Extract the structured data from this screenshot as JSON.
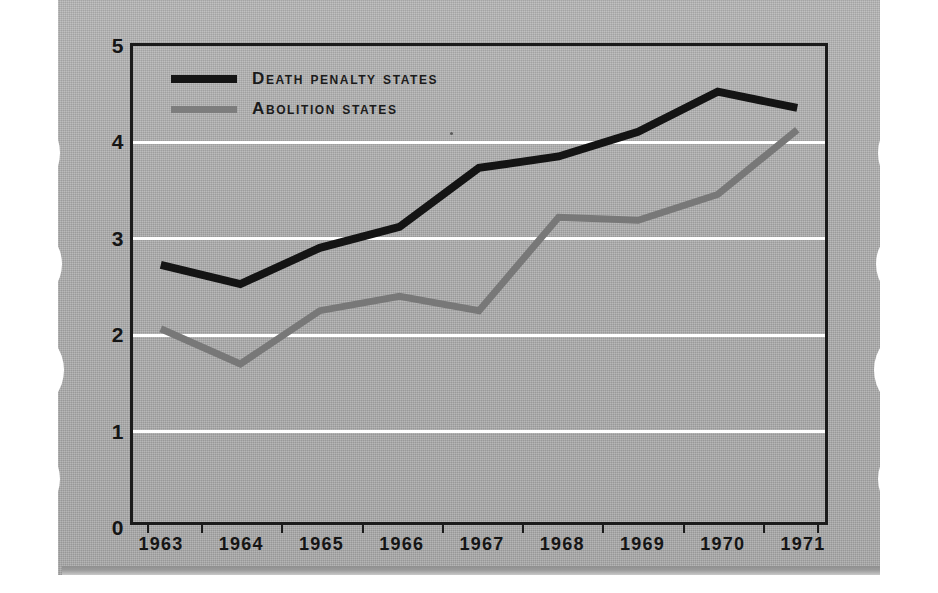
{
  "page": {
    "media": "scanned-book-page",
    "background_color": "#a9a9a9",
    "ink_color": "#1b1b1b"
  },
  "legend": {
    "position": "top-left-inside-plot",
    "entries": [
      {
        "label": "Death penalty states",
        "color": "#141414",
        "swatch": "line"
      },
      {
        "label": "Abolition states",
        "color": "#787878",
        "swatch": "line"
      }
    ]
  },
  "chart_data": {
    "type": "line",
    "title": "",
    "subtitle": "",
    "xlabel": "",
    "ylabel": "",
    "x": [
      "1963",
      "1964",
      "1965",
      "1966",
      "1967",
      "1968",
      "1969",
      "1970",
      "1971"
    ],
    "categories": [
      "1963",
      "1964",
      "1965",
      "1966",
      "1967",
      "1968",
      "1969",
      "1970",
      "1971"
    ],
    "ylim": [
      0,
      5
    ],
    "yticks": [
      "0",
      "1",
      "2",
      "3",
      "4",
      "5"
    ],
    "ytick_values": [
      0,
      1,
      2,
      3,
      4,
      5
    ],
    "grid": "horizontal-white-gridlines-at-1-2-3-4",
    "legend_position": "upper left",
    "series": [
      {
        "name": "Death penalty states",
        "color": "#141414",
        "values": [
          2.7,
          2.5,
          2.88,
          3.1,
          3.72,
          3.84,
          4.1,
          4.52,
          4.35
        ]
      },
      {
        "name": "Abolition states",
        "color": "#787878",
        "values": [
          2.03,
          1.66,
          2.22,
          2.37,
          2.22,
          3.2,
          3.17,
          3.44,
          4.12
        ]
      }
    ]
  }
}
